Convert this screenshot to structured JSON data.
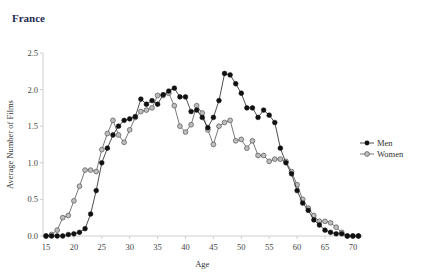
{
  "title": "France",
  "chart_data": {
    "type": "line",
    "title": "France",
    "xlabel": "Age",
    "ylabel": "Average Number of Films",
    "xlim": [
      15,
      71
    ],
    "ylim": [
      0,
      2.5
    ],
    "xticks": [
      15,
      20,
      25,
      30,
      35,
      40,
      45,
      50,
      55,
      60,
      65,
      70
    ],
    "yticks": [
      "0.0",
      "0.5",
      "1.0",
      "1.5",
      "2.0",
      "2.5"
    ],
    "grid": false,
    "legend_position": "right",
    "x": [
      15,
      16,
      17,
      18,
      19,
      20,
      21,
      22,
      23,
      24,
      25,
      26,
      27,
      28,
      29,
      30,
      31,
      32,
      33,
      34,
      35,
      36,
      37,
      38,
      39,
      40,
      41,
      42,
      43,
      44,
      45,
      46,
      47,
      48,
      49,
      50,
      51,
      52,
      53,
      54,
      55,
      56,
      57,
      58,
      59,
      60,
      61,
      62,
      63,
      64,
      65,
      66,
      67,
      68,
      69,
      70,
      71
    ],
    "series": [
      {
        "name": "Men",
        "color": "#111111",
        "marker": "filled-circle",
        "values": [
          0,
          0,
          0,
          0,
          0.02,
          0.03,
          0.05,
          0.1,
          0.3,
          0.62,
          1.0,
          1.2,
          1.38,
          1.5,
          1.58,
          1.6,
          1.63,
          1.87,
          1.8,
          1.85,
          1.8,
          1.93,
          1.98,
          2.02,
          1.9,
          1.9,
          1.7,
          1.72,
          1.62,
          1.48,
          1.62,
          1.85,
          2.22,
          2.2,
          2.08,
          1.95,
          1.75,
          1.75,
          1.62,
          1.72,
          1.65,
          1.55,
          1.2,
          1.0,
          0.85,
          0.62,
          0.45,
          0.35,
          0.22,
          0.15,
          0.08,
          0.05,
          0.03,
          0.03,
          0,
          0,
          0
        ]
      },
      {
        "name": "Women",
        "color": "#9a9a9a",
        "marker": "hollow-gray-circle",
        "values": [
          0,
          0.02,
          0.08,
          0.25,
          0.28,
          0.48,
          0.68,
          0.9,
          0.9,
          0.88,
          1.18,
          1.4,
          1.58,
          1.38,
          1.28,
          1.45,
          1.62,
          1.7,
          1.72,
          1.75,
          1.92,
          1.92,
          1.95,
          1.78,
          1.5,
          1.42,
          1.52,
          1.78,
          1.68,
          1.45,
          1.25,
          1.5,
          1.55,
          1.58,
          1.3,
          1.32,
          1.2,
          1.3,
          1.1,
          1.1,
          1.02,
          1.05,
          1.05,
          1.02,
          0.88,
          0.7,
          0.5,
          0.38,
          0.28,
          0.2,
          0.2,
          0.18,
          0.12,
          0.05,
          0,
          0,
          0
        ]
      }
    ]
  }
}
